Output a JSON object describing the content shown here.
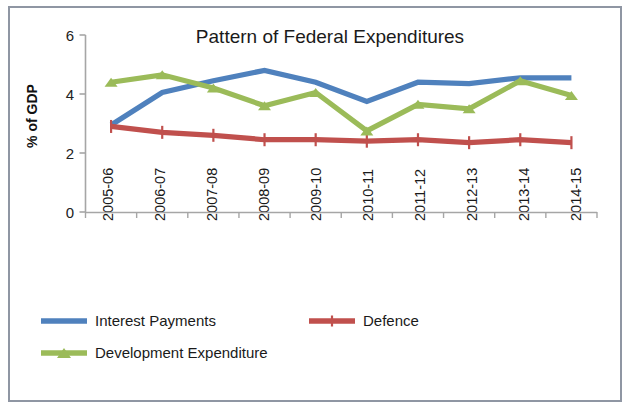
{
  "chart_data": {
    "type": "line",
    "title": "Pattern of Federal Expenditures",
    "xlabel": "",
    "ylabel": "% of GDP",
    "ylim": [
      0,
      6
    ],
    "yticks": [
      0,
      2,
      4,
      6
    ],
    "grid": false,
    "legend_position": "bottom",
    "categories": [
      "2005-06",
      "2006-07",
      "2007-08",
      "2008-09",
      "2009-10",
      "2010-11",
      "2011-12",
      "2012-13",
      "2013-14",
      "2014-15"
    ],
    "series": [
      {
        "name": "Interest Payments",
        "color": "#4f81bd",
        "marker": "none",
        "values": [
          2.95,
          4.05,
          4.45,
          4.8,
          4.4,
          3.75,
          4.4,
          4.35,
          4.55,
          4.55
        ]
      },
      {
        "name": "Defence",
        "color": "#c0504d",
        "marker": "plus",
        "values": [
          2.9,
          2.7,
          2.6,
          2.45,
          2.45,
          2.4,
          2.45,
          2.35,
          2.45,
          2.35
        ]
      },
      {
        "name": "Development Expenditure",
        "color": "#9bbb59",
        "marker": "triangle",
        "values": [
          4.4,
          4.65,
          4.2,
          3.6,
          4.05,
          2.75,
          3.65,
          3.5,
          4.45,
          3.95
        ]
      }
    ]
  },
  "legend": {
    "items": [
      {
        "label": "Interest Payments"
      },
      {
        "label": "Defence"
      },
      {
        "label": "Development Expenditure"
      }
    ]
  },
  "axis": {
    "y_tick_labels": [
      "6",
      "4",
      "2",
      "0"
    ]
  }
}
